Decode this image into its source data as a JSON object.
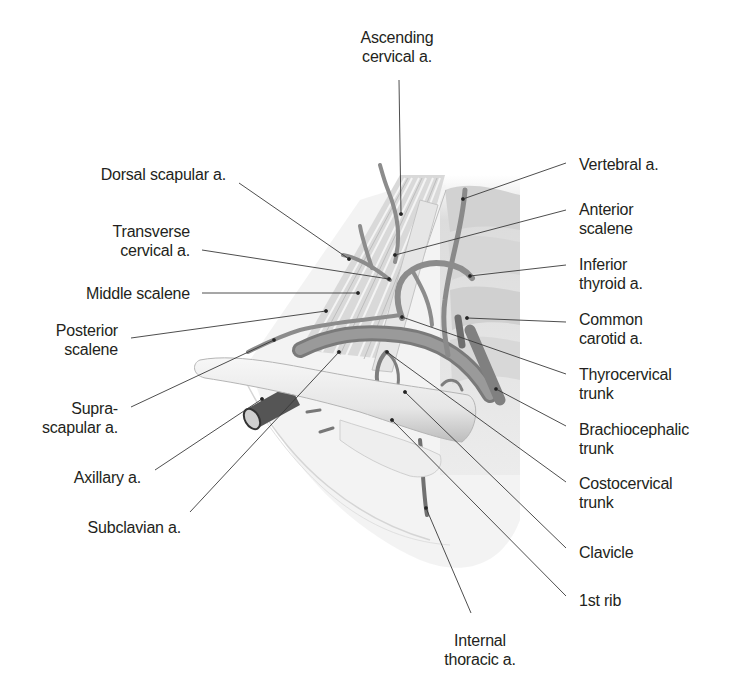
{
  "figure": {
    "labels": [
      {
        "id": "ascending-cervical",
        "lines": [
          "Ascending",
          "cervical a."
        ],
        "x": 397,
        "y": 28,
        "align": "c"
      },
      {
        "id": "dorsal-scapular",
        "lines": [
          "Dorsal scapular a."
        ],
        "x": 226,
        "y": 165,
        "align": "r"
      },
      {
        "id": "transverse-cervical",
        "lines": [
          "Transverse",
          "cervical a."
        ],
        "x": 190,
        "y": 222,
        "align": "r"
      },
      {
        "id": "middle-scalene",
        "lines": [
          "Middle scalene"
        ],
        "x": 190,
        "y": 284,
        "align": "r"
      },
      {
        "id": "posterior-scalene",
        "lines": [
          "Posterior",
          "scalene"
        ],
        "x": 118,
        "y": 321,
        "align": "r"
      },
      {
        "id": "suprascapular",
        "lines": [
          "Supra-",
          "scapular a."
        ],
        "x": 118,
        "y": 399,
        "align": "r"
      },
      {
        "id": "axillary",
        "lines": [
          "Axillary a."
        ],
        "x": 141,
        "y": 468,
        "align": "r"
      },
      {
        "id": "subclavian",
        "lines": [
          "Subclavian a."
        ],
        "x": 181,
        "y": 518,
        "align": "r"
      },
      {
        "id": "vertebral",
        "lines": [
          "Vertebral a."
        ],
        "x": 579,
        "y": 155,
        "align": "l"
      },
      {
        "id": "anterior-scalene",
        "lines": [
          "Anterior",
          "scalene"
        ],
        "x": 579,
        "y": 200,
        "align": "l"
      },
      {
        "id": "inferior-thyroid",
        "lines": [
          "Inferior",
          "thyroid a."
        ],
        "x": 579,
        "y": 255,
        "align": "l"
      },
      {
        "id": "common-carotid",
        "lines": [
          "Common",
          "carotid a."
        ],
        "x": 579,
        "y": 310,
        "align": "l"
      },
      {
        "id": "thyrocervical",
        "lines": [
          "Thyrocervical",
          "trunk"
        ],
        "x": 579,
        "y": 365,
        "align": "l"
      },
      {
        "id": "brachiocephalic",
        "lines": [
          "Brachiocephalic",
          "trunk"
        ],
        "x": 579,
        "y": 420,
        "align": "l"
      },
      {
        "id": "costocervical",
        "lines": [
          "Costocervical",
          "trunk"
        ],
        "x": 579,
        "y": 474,
        "align": "l"
      },
      {
        "id": "clavicle",
        "lines": [
          "Clavicle"
        ],
        "x": 579,
        "y": 543,
        "align": "l"
      },
      {
        "id": "first-rib",
        "lines": [
          "1st rib"
        ],
        "x": 579,
        "y": 591,
        "align": "l"
      },
      {
        "id": "internal-thoracic",
        "lines": [
          "Internal",
          "thoracic a."
        ],
        "x": 480,
        "y": 631,
        "align": "c"
      }
    ],
    "leaders": [
      {
        "id": "ascending-cervical",
        "x1": 399,
        "y1": 80,
        "x2": 401,
        "y2": 214
      },
      {
        "id": "dorsal-scapular",
        "x1": 239,
        "y1": 183,
        "x2": 349,
        "y2": 259
      },
      {
        "id": "transverse-cervical",
        "x1": 202,
        "y1": 250,
        "x2": 389,
        "y2": 279
      },
      {
        "id": "middle-scalene",
        "x1": 202,
        "y1": 293,
        "x2": 358,
        "y2": 293
      },
      {
        "id": "posterior-scalene",
        "x1": 131,
        "y1": 338,
        "x2": 326,
        "y2": 311
      },
      {
        "id": "suprascapular",
        "x1": 131,
        "y1": 407,
        "x2": 274,
        "y2": 340
      },
      {
        "id": "axillary",
        "x1": 155,
        "y1": 470,
        "x2": 262,
        "y2": 399
      },
      {
        "id": "subclavian",
        "x1": 190,
        "y1": 512,
        "x2": 339,
        "y2": 352
      },
      {
        "id": "vertebral",
        "x1": 566,
        "y1": 163,
        "x2": 463,
        "y2": 199
      },
      {
        "id": "anterior-scalene",
        "x1": 566,
        "y1": 210,
        "x2": 395,
        "y2": 255
      },
      {
        "id": "inferior-thyroid",
        "x1": 566,
        "y1": 265,
        "x2": 470,
        "y2": 276
      },
      {
        "id": "common-carotid",
        "x1": 566,
        "y1": 322,
        "x2": 467,
        "y2": 318
      },
      {
        "id": "thyrocervical",
        "x1": 566,
        "y1": 374,
        "x2": 402,
        "y2": 317
      },
      {
        "id": "brachiocephalic",
        "x1": 566,
        "y1": 426,
        "x2": 496,
        "y2": 389
      },
      {
        "id": "costocervical",
        "x1": 566,
        "y1": 482,
        "x2": 387,
        "y2": 352
      },
      {
        "id": "clavicle",
        "x1": 566,
        "y1": 548,
        "x2": 405,
        "y2": 392
      },
      {
        "id": "first-rib",
        "x1": 566,
        "y1": 596,
        "x2": 392,
        "y2": 420
      },
      {
        "id": "internal-thoracic",
        "x1": 471,
        "y1": 613,
        "x2": 426,
        "y2": 508
      }
    ]
  }
}
